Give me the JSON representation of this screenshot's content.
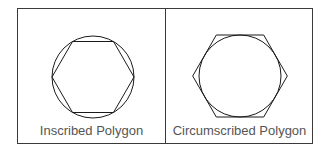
{
  "panels": [
    {
      "label": "Inscribed Polygon",
      "shape": "hexagon inscribed in circle",
      "circle": {
        "cx": 93,
        "cy": 77,
        "r": 41
      },
      "hexagon_vertex_radius": 41
    },
    {
      "label": "Circumscribed Polygon",
      "shape": "hexagon circumscribed about circle",
      "circle": {
        "cx": 240,
        "cy": 76,
        "r": 41
      },
      "hexagon_vertex_radius": 47
    }
  ],
  "colors": {
    "stroke": "#1a1a1a",
    "frame": "#3a3a3a",
    "label": "#555555"
  }
}
